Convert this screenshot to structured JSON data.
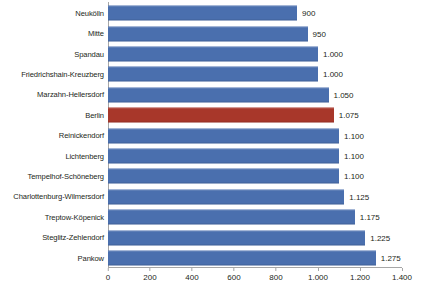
{
  "chart_data": {
    "type": "bar",
    "orientation": "horizontal",
    "title": "",
    "subtitle": "",
    "xlabel": "",
    "ylabel": "",
    "grid": false,
    "legend": "none",
    "xlim": [
      0,
      1400
    ],
    "xticks": [
      0,
      200,
      400,
      600,
      800,
      1000,
      1200,
      1400
    ],
    "xtick_labels": [
      "0",
      "200",
      "400",
      "600",
      "800",
      "1.000",
      "1.200",
      "1.400"
    ],
    "categories": [
      "Neukölln",
      "Mitte",
      "Spandau",
      "Friedrichshain-Kreuzberg",
      "Marzahn-Hellersdorf",
      "Berlin",
      "Reinickendorf",
      "Lichtenberg",
      "Tempelhof-Schöneberg",
      "Charlottenburg-Wilmersdorf",
      "Treptow-Köpenick",
      "Steglitz-Zehlendorf",
      "Pankow"
    ],
    "values": [
      900,
      950,
      1000,
      1000,
      1050,
      1075,
      1100,
      1100,
      1100,
      1125,
      1175,
      1225,
      1275
    ],
    "value_labels": [
      "900",
      "950",
      "1.000",
      "1.000",
      "1.050",
      "1.075",
      "1.100",
      "1.100",
      "1.100",
      "1.125",
      "1.175",
      "1.225",
      "1.275"
    ],
    "highlight_index": 5,
    "colors": {
      "bar": "#4a6fae",
      "highlight": "#a8372a",
      "axis": "#a6a6a6",
      "text": "#231f20",
      "background": "#ffffff"
    }
  }
}
